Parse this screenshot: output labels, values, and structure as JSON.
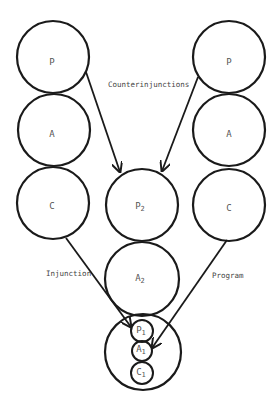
{
  "diagram": {
    "type": "ego-state transactional diagram",
    "stroke_color": "#1a1a1a",
    "label_color": "#555555",
    "left_parent": {
      "P": {
        "label": "P"
      },
      "A": {
        "label": "A"
      },
      "C": {
        "label": "C"
      }
    },
    "right_parent": {
      "P": {
        "label": "P"
      },
      "A": {
        "label": "A"
      },
      "C": {
        "label": "C"
      }
    },
    "child": {
      "P2": {
        "label": "P",
        "subscript": "2"
      },
      "A2": {
        "label": "A",
        "subscript": "2"
      },
      "C2_inner": {
        "P1": {
          "label": "P",
          "subscript": "1"
        },
        "A1": {
          "label": "A",
          "subscript": "1"
        },
        "C1": {
          "label": "C",
          "subscript": "1"
        }
      }
    },
    "edge_labels": {
      "counterinjunctions": "Counterinjunctions",
      "injunction": "Injunction",
      "program": "Program"
    }
  }
}
